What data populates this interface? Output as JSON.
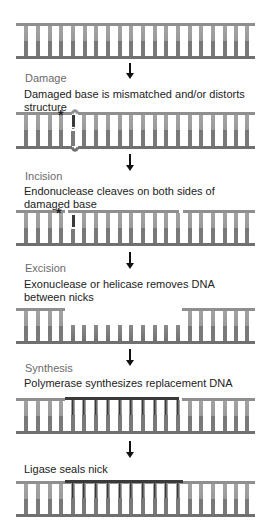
{
  "colors": {
    "strand": "#8a8a8a",
    "strand_dark": "#6f6f6f",
    "rung_top": "#9a9a9a",
    "rung_bottom": "#7a7a7a",
    "new_strand": "#3a3a3a",
    "arrow": "#111111"
  },
  "steps": [
    {
      "name": "intact",
      "label": "",
      "description": ""
    },
    {
      "name": "damage",
      "label": "Damage",
      "description": "Damaged base is mismatched and/or distorts structure",
      "marker": "*"
    },
    {
      "name": "incision",
      "label": "Incision",
      "description": "Endonuclease cleaves on both sides of damaged base",
      "marker": "*"
    },
    {
      "name": "excision",
      "label": "Excision",
      "description": "Exonuclease or helicase removes DNA between nicks"
    },
    {
      "name": "synthesis",
      "label": "Synthesis",
      "description": "Polymerase synthesizes replacement DNA"
    },
    {
      "name": "ligation",
      "label": "",
      "description": "Ligase seals nick"
    }
  ]
}
